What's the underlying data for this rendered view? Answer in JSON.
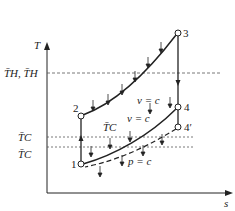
{
  "diagram": {
    "type": "T-s diagram",
    "axes": {
      "y_label": "T",
      "x_label": "s"
    },
    "reference_lines": {
      "hot": "T̄H, T̄H",
      "cold_upper": "T̄C",
      "cold_lower": "T̄C"
    },
    "points": {
      "p1": "1",
      "p2": "2",
      "p3": "3",
      "p4": "4",
      "p4prime": "4′"
    },
    "process_labels": {
      "heat_addition": "v = c",
      "heat_rejection_const_v": "v = c",
      "heat_rejection_const_p": "p = c",
      "mean_cold_label": "T̄C"
    },
    "colors": {
      "line": "#222222",
      "dashed": "#555555",
      "background": "#ffffff"
    }
  }
}
